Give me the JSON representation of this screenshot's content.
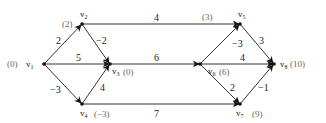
{
  "diagram": {
    "type": "directed weighted graph",
    "nodes": [
      {
        "id": "v1",
        "name": "v",
        "sub": "1",
        "value": "(0)",
        "x": 44,
        "y": 64
      },
      {
        "id": "v2",
        "name": "v",
        "sub": "2",
        "value": "(2)",
        "x": 82,
        "y": 24
      },
      {
        "id": "v3",
        "name": "v",
        "sub": "3",
        "value": "(0)",
        "x": 110,
        "y": 64
      },
      {
        "id": "v4",
        "name": "v",
        "sub": "4",
        "value": "(−3)",
        "x": 82,
        "y": 104
      },
      {
        "id": "v5",
        "name": "v",
        "sub": "5",
        "value": "(3)",
        "x": 240,
        "y": 24
      },
      {
        "id": "v6",
        "name": "v",
        "sub": "6",
        "value": "(6)",
        "x": 200,
        "y": 64
      },
      {
        "id": "v7",
        "name": "v",
        "sub": "7",
        "value": "(9)",
        "x": 240,
        "y": 104
      },
      {
        "id": "v8",
        "name": "v",
        "sub": "8",
        "value": "(10)",
        "x": 274,
        "y": 64
      }
    ],
    "edges": [
      {
        "from": "v1",
        "to": "v2",
        "weight": "2"
      },
      {
        "from": "v1",
        "to": "v3",
        "weight": "5"
      },
      {
        "from": "v1",
        "to": "v4",
        "weight": "−3"
      },
      {
        "from": "v2",
        "to": "v3",
        "weight": "−2"
      },
      {
        "from": "v4",
        "to": "v3",
        "weight": "4"
      },
      {
        "from": "v2",
        "to": "v5",
        "weight": "4"
      },
      {
        "from": "v3",
        "to": "v6",
        "weight": "6"
      },
      {
        "from": "v4",
        "to": "v7",
        "weight": "7"
      },
      {
        "from": "v6",
        "to": "v5",
        "weight": "−3"
      },
      {
        "from": "v6",
        "to": "v8",
        "weight": "4"
      },
      {
        "from": "v6",
        "to": "v7",
        "weight": "2"
      },
      {
        "from": "v5",
        "to": "v8",
        "weight": "3"
      },
      {
        "from": "v7",
        "to": "v8",
        "weight": "−1"
      }
    ]
  }
}
